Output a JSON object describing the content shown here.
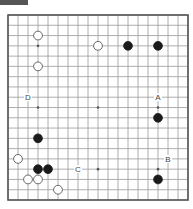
{
  "diagram": {
    "type": "go-board",
    "size": 19,
    "colors": {
      "board": "#ffffff",
      "lines": "#9a9a9a",
      "border": "#555555",
      "black_stone": "#1a1a1a",
      "white_stone": "#ffffff",
      "white_outline": "#444444",
      "label": "#444444",
      "header": "#555555"
    },
    "star_points": [
      [
        3,
        3
      ],
      [
        9,
        3
      ],
      [
        15,
        3
      ],
      [
        3,
        9
      ],
      [
        9,
        9
      ],
      [
        15,
        9
      ],
      [
        3,
        15
      ],
      [
        9,
        15
      ],
      [
        15,
        15
      ]
    ],
    "stones": [
      {
        "color": "white",
        "col": 3,
        "row": 2
      },
      {
        "color": "white",
        "col": 9,
        "row": 3
      },
      {
        "color": "black",
        "col": 12,
        "row": 3
      },
      {
        "color": "black",
        "col": 15,
        "row": 3
      },
      {
        "color": "white",
        "col": 3,
        "row": 5
      },
      {
        "color": "black",
        "col": 15,
        "row": 10
      },
      {
        "color": "black",
        "col": 3,
        "row": 12
      },
      {
        "color": "white",
        "col": 1,
        "row": 14
      },
      {
        "color": "black",
        "col": 3,
        "row": 15
      },
      {
        "color": "black",
        "col": 4,
        "row": 15
      },
      {
        "color": "white",
        "col": 2,
        "row": 16
      },
      {
        "color": "white",
        "col": 3,
        "row": 16
      },
      {
        "color": "black",
        "col": 15,
        "row": 16
      },
      {
        "color": "white",
        "col": 5,
        "row": 17
      }
    ],
    "labels": [
      {
        "text": "D",
        "col": 2,
        "row": 8
      },
      {
        "text": "A",
        "col": 15,
        "row": 8
      },
      {
        "text": "B",
        "col": 16,
        "row": 14
      },
      {
        "text": "C",
        "col": 7,
        "row": 15
      }
    ]
  }
}
